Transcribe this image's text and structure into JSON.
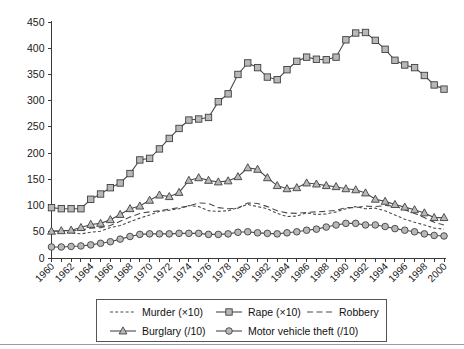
{
  "chart_data": {
    "type": "line",
    "title": "",
    "xlabel": "",
    "ylabel": "",
    "ylim": [
      0,
      450
    ],
    "ytick_step": 50,
    "grid": false,
    "legend_position": "bottom",
    "x": [
      1960,
      1961,
      1962,
      1963,
      1964,
      1965,
      1966,
      1967,
      1968,
      1969,
      1970,
      1971,
      1972,
      1973,
      1974,
      1975,
      1976,
      1977,
      1978,
      1979,
      1980,
      1981,
      1982,
      1983,
      1984,
      1985,
      1986,
      1987,
      1988,
      1989,
      1990,
      1991,
      1992,
      1993,
      1994,
      1995,
      1996,
      1997,
      1998,
      1999,
      2000
    ],
    "xtick_labels": [
      "1960",
      "1962",
      "1964",
      "1966",
      "1968",
      "1970",
      "1972",
      "1974",
      "1976",
      "1978",
      "1980",
      "1982",
      "1984",
      "1986",
      "1988",
      "1990",
      "1992",
      "1994",
      "1996",
      "1998",
      "2000"
    ],
    "ytick_labels": [
      "0",
      "50",
      "100",
      "150",
      "200",
      "250",
      "300",
      "350",
      "400",
      "450"
    ],
    "series": [
      {
        "name": "Murder (×10)",
        "style": "dotted",
        "marker": "none",
        "values": [
          50,
          50,
          48,
          46,
          49,
          51,
          58,
          62,
          69,
          76,
          82,
          89,
          91,
          94,
          100,
          98,
          90,
          89,
          90,
          96,
          102,
          98,
          94,
          85,
          79,
          80,
          86,
          83,
          84,
          88,
          94,
          98,
          94,
          95,
          90,
          82,
          74,
          68,
          63,
          57,
          55
        ]
      },
      {
        "name": "Rape (×10)",
        "style": "solid",
        "marker": "square",
        "values": [
          96,
          94,
          94,
          94,
          112,
          122,
          134,
          143,
          161,
          187,
          190,
          208,
          228,
          247,
          263,
          265,
          268,
          298,
          313,
          350,
          372,
          363,
          345,
          340,
          359,
          375,
          383,
          379,
          378,
          383,
          416,
          429,
          430,
          415,
          398,
          377,
          368,
          363,
          348,
          330,
          322
        ]
      },
      {
        "name": "Robbery",
        "style": "dashed",
        "marker": "none",
        "values": [
          51,
          52,
          52,
          53,
          57,
          58,
          62,
          70,
          78,
          85,
          88,
          90,
          93,
          96,
          99,
          105,
          104,
          96,
          94,
          95,
          105,
          104,
          98,
          90,
          86,
          85,
          87,
          88,
          89,
          91,
          96,
          96,
          99,
          98,
          100,
          99,
          92,
          85,
          77,
          68,
          63
        ]
      },
      {
        "name": "Burglary (/10)",
        "style": "solid",
        "marker": "triangle",
        "values": [
          51,
          52,
          53,
          58,
          64,
          66,
          73,
          83,
          94,
          99,
          110,
          120,
          117,
          125,
          148,
          153,
          148,
          145,
          147,
          155,
          172,
          169,
          153,
          138,
          132,
          134,
          143,
          141,
          138,
          136,
          132,
          130,
          124,
          112,
          108,
          102,
          97,
          92,
          86,
          77,
          77
        ]
      },
      {
        "name": "Motor vehicle theft (/10)",
        "style": "solid",
        "marker": "circle",
        "values": [
          21,
          21,
          22,
          23,
          25,
          28,
          31,
          36,
          41,
          45,
          46,
          46,
          46,
          47,
          47,
          47,
          45,
          45,
          46,
          49,
          50,
          48,
          47,
          46,
          48,
          50,
          53,
          55,
          59,
          63,
          66,
          66,
          63,
          63,
          60,
          56,
          53,
          50,
          46,
          43,
          42
        ]
      }
    ]
  },
  "legend": {
    "entries": [
      {
        "label": "Murder (×10)"
      },
      {
        "label": "Rape (×10)"
      },
      {
        "label": "Robbery"
      },
      {
        "label": "Burglary (/10)"
      },
      {
        "label": "Motor vehicle theft (/10)"
      }
    ]
  },
  "colors": {
    "marker_fill": "#b8b8b8",
    "marker_stroke": "#3f3f3f",
    "line": "#4a4a4a",
    "axis": "#3a3a3a",
    "text": "#1a1a1a",
    "background": "#ffffff"
  }
}
